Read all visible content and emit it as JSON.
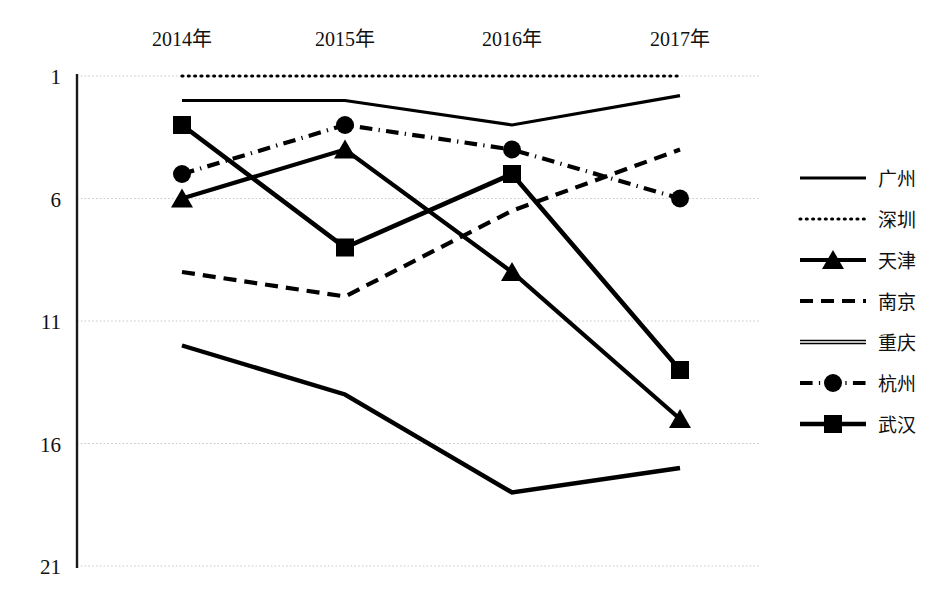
{
  "chart_data": {
    "type": "line",
    "title": "",
    "subtitle": "",
    "xlabel": "",
    "ylabel": "",
    "categories": [
      "2014年",
      "2015年",
      "2016年",
      "2017年"
    ],
    "ytick_labels": [
      "1",
      "6",
      "11",
      "16",
      "21"
    ],
    "ytick_values": [
      1,
      6,
      11,
      16,
      21
    ],
    "ylim": [
      1,
      21
    ],
    "y_axis_inverted": true,
    "grid": true,
    "legend_position": "right",
    "series": [
      {
        "name": "广州",
        "values": [
          2.0,
          2.0,
          3.0,
          1.8
        ],
        "style": "solid",
        "marker": "none",
        "color": "#000000",
        "width": 3.2
      },
      {
        "name": "深圳",
        "values": [
          1.0,
          1.0,
          1.0,
          1.0
        ],
        "style": "dotted",
        "marker": "none",
        "color": "#000000",
        "width": 3.2
      },
      {
        "name": "天津",
        "values": [
          6.0,
          4.0,
          9.0,
          15.0
        ],
        "style": "solid",
        "marker": "triangle",
        "color": "#000000",
        "width": 4.2
      },
      {
        "name": "南京",
        "values": [
          9.0,
          10.0,
          6.5,
          4.0
        ],
        "style": "dashed",
        "marker": "none",
        "color": "#000000",
        "width": 4.2
      },
      {
        "name": "重庆",
        "values": [
          12.0,
          14.0,
          18.0,
          17.0
        ],
        "style": "double",
        "marker": "none",
        "color": "#000000",
        "width": 1.6
      },
      {
        "name": "杭州",
        "values": [
          5.0,
          3.0,
          4.0,
          6.0
        ],
        "style": "dashdot",
        "marker": "circle",
        "color": "#000000",
        "width": 4.2
      },
      {
        "name": "武汉",
        "values": [
          3.0,
          8.0,
          5.0,
          13.0
        ],
        "style": "solid",
        "marker": "square",
        "color": "#000000",
        "width": 4.6
      }
    ]
  },
  "legend": {
    "entries": [
      {
        "label": "广州"
      },
      {
        "label": "深圳"
      },
      {
        "label": "天津"
      },
      {
        "label": "南京"
      },
      {
        "label": "重庆"
      },
      {
        "label": "杭州"
      },
      {
        "label": "武汉"
      }
    ]
  }
}
